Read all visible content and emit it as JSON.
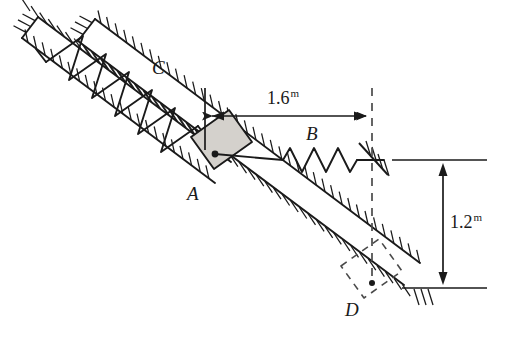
{
  "figure": {
    "type": "physics-free-body-diagram",
    "background_color": "#ffffff",
    "line_color": "#1a1a1a",
    "block_fill_color": "#d4d1cc",
    "incline_angle_deg": 37
  },
  "labels": {
    "spring_c": "C",
    "block_a": "A",
    "spring_b": "B",
    "position_d": "D"
  },
  "dimensions": {
    "horizontal": {
      "value": "1.6",
      "unit": "m"
    },
    "vertical": {
      "value": "1.2",
      "unit": "m"
    }
  },
  "elements": {
    "incline_rail_upper": "upper-guide-rail",
    "incline_rail_lower": "lower-guide-rail",
    "hatching": "ground-hatching",
    "compression_spring": "zigzag-spring-c",
    "coil_spring": "zigzag-spring-b",
    "wall_support": "fixed-hatched-support",
    "block": "shaded-block-a",
    "ghost_block": "dashed-block-d",
    "dim_line_horizontal": "dimension-line-1-6m",
    "dim_line_vertical": "dimension-line-1-2m",
    "reference_line_top": "horizontal-reference-top",
    "reference_line_bottom": "horizontal-reference-bottom",
    "projection_line": "vertical-dashed-projection"
  }
}
